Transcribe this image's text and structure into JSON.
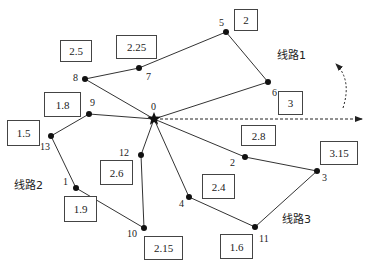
{
  "depot": {
    "id": "0",
    "x": 154,
    "y": 119
  },
  "nodes": [
    {
      "id": "1",
      "x": 76,
      "y": 188,
      "lx": 63,
      "ly": 177
    },
    {
      "id": "2",
      "x": 245,
      "y": 157,
      "lx": 230,
      "ly": 158
    },
    {
      "id": "3",
      "x": 317,
      "y": 171,
      "lx": 322,
      "ly": 173
    },
    {
      "id": "4",
      "x": 189,
      "y": 197,
      "lx": 179,
      "ly": 199
    },
    {
      "id": "5",
      "x": 226,
      "y": 32,
      "lx": 219,
      "ly": 18
    },
    {
      "id": "6",
      "x": 268,
      "y": 82,
      "lx": 272,
      "ly": 88
    },
    {
      "id": "7",
      "x": 139,
      "y": 68,
      "lx": 146,
      "ly": 72
    },
    {
      "id": "8",
      "x": 85,
      "y": 79,
      "lx": 73,
      "ly": 73
    },
    {
      "id": "9",
      "x": 89,
      "y": 114,
      "lx": 90,
      "ly": 98
    },
    {
      "id": "10",
      "x": 144,
      "y": 228,
      "lx": 127,
      "ly": 229
    },
    {
      "id": "11",
      "x": 255,
      "y": 227,
      "lx": 259,
      "ly": 234
    },
    {
      "id": "12",
      "x": 141,
      "y": 155,
      "lx": 119,
      "ly": 148
    },
    {
      "id": "13",
      "x": 51,
      "y": 136,
      "lx": 40,
      "ly": 142
    }
  ],
  "weights": [
    {
      "value": "2",
      "x": 234,
      "y": 9,
      "w": 24,
      "h": 22
    },
    {
      "value": "2.5",
      "x": 60,
      "y": 40,
      "w": 32,
      "h": 22
    },
    {
      "value": "2.25",
      "x": 116,
      "y": 35,
      "w": 41,
      "h": 24
    },
    {
      "value": "3",
      "x": 278,
      "y": 91,
      "w": 25,
      "h": 24
    },
    {
      "value": "1.8",
      "x": 44,
      "y": 92,
      "w": 37,
      "h": 25
    },
    {
      "value": "1.5",
      "x": 7,
      "y": 120,
      "w": 33,
      "h": 26
    },
    {
      "value": "2.8",
      "x": 241,
      "y": 125,
      "w": 35,
      "h": 21
    },
    {
      "value": "3.15",
      "x": 320,
      "y": 141,
      "w": 38,
      "h": 24
    },
    {
      "value": "2.6",
      "x": 100,
      "y": 160,
      "w": 33,
      "h": 25
    },
    {
      "value": "2.4",
      "x": 202,
      "y": 174,
      "w": 33,
      "h": 25
    },
    {
      "value": "1.9",
      "x": 64,
      "y": 196,
      "w": 33,
      "h": 26
    },
    {
      "value": "2.15",
      "x": 144,
      "y": 236,
      "w": 39,
      "h": 24
    },
    {
      "value": "1.6",
      "x": 220,
      "y": 234,
      "w": 33,
      "h": 25
    }
  ],
  "routes": [
    {
      "name": "线路1",
      "path": [
        "0",
        "6",
        "5",
        "7",
        "8",
        "0"
      ],
      "label_x": 277,
      "label_y": 46
    },
    {
      "name": "线路2",
      "path": [
        "0",
        "9",
        "13",
        "1",
        "10",
        "12",
        "0"
      ],
      "label_x": 14,
      "label_y": 176
    },
    {
      "name": "线路3",
      "path": [
        "0",
        "2",
        "3",
        "11",
        "4",
        "0"
      ],
      "label_x": 282,
      "label_y": 210
    }
  ],
  "icons": {
    "depot": "star-icon",
    "direction_arrow": "dashed-arrow-icon",
    "rotation_arrow": "curved-dashed-arrow-icon"
  }
}
